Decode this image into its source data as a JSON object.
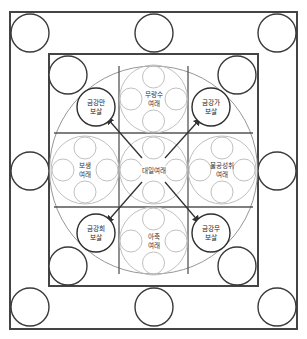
{
  "diagram": {
    "title": "",
    "center": {
      "name": "대일여래",
      "lines": [
        "대일여래"
      ]
    },
    "buddhas": [
      {
        "id": "north",
        "lines": [
          "무량수",
          "여래"
        ]
      },
      {
        "id": "west",
        "lines": [
          "보생",
          "여래"
        ]
      },
      {
        "id": "east",
        "lines": [
          "불공성취",
          "여래"
        ]
      },
      {
        "id": "south",
        "lines": [
          "아축",
          "여래"
        ]
      }
    ],
    "bodhisattvas": [
      {
        "id": "top-left",
        "lines": [
          "금강만",
          "보살"
        ]
      },
      {
        "id": "top-right",
        "lines": [
          "금강가",
          "보살"
        ]
      },
      {
        "id": "bottom-left",
        "lines": [
          "금강희",
          "보살"
        ]
      },
      {
        "id": "bottom-right",
        "lines": [
          "금강무",
          "보살"
        ]
      }
    ],
    "colors": {
      "line": "#444444",
      "pale_line": "#b9b9b9",
      "background": "#ffffff"
    }
  }
}
